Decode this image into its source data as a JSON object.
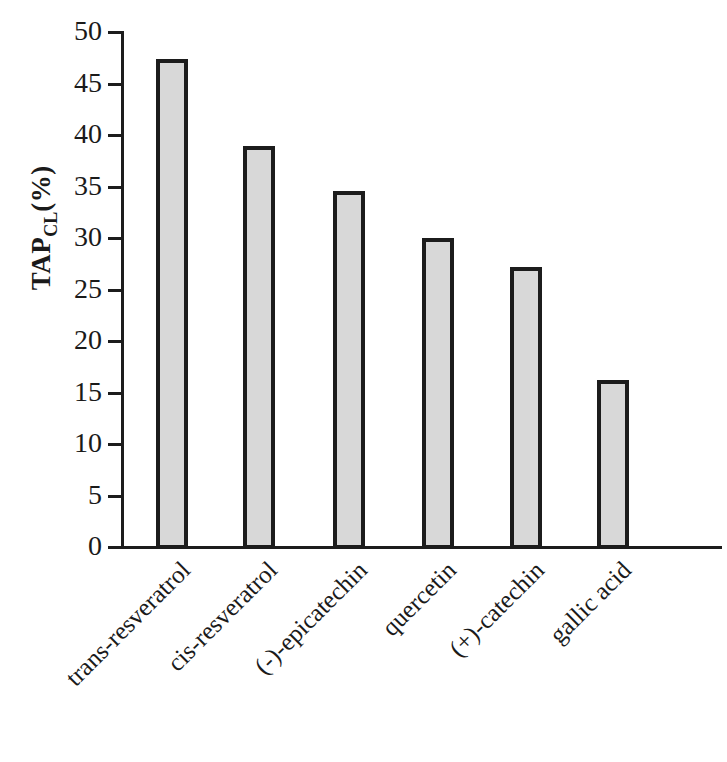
{
  "chart_data": {
    "type": "bar",
    "title": "",
    "subtitle": "",
    "xlabel": "",
    "ylabel": "TAP_CL (%)",
    "ylabel_parts": {
      "main": "TAP",
      "subscript": "CL",
      "unit": "(%)"
    },
    "categories": [
      "trans-resveratrol",
      "cis-resveratrol",
      "(-)-epicatechin",
      "quercetin",
      "(+)-catechin",
      "gallic acid"
    ],
    "values": [
      47.4,
      38.9,
      34.6,
      30.0,
      27.2,
      16.2
    ],
    "ylim": [
      0,
      50
    ],
    "yticks": [
      0,
      5,
      10,
      15,
      20,
      25,
      30,
      35,
      40,
      45,
      50
    ],
    "ytick_labels": [
      "0",
      "5",
      "10",
      "15",
      "20",
      "25",
      "30",
      "35",
      "40",
      "45",
      "50"
    ],
    "grid": false,
    "legend": null,
    "bar_fill_color": "#d8d8d8",
    "bar_edge_color": "#1c1c1c",
    "axis_color": "#1c1c1c",
    "background_color": "#ffffff",
    "xtick_label_rotation": 45
  }
}
